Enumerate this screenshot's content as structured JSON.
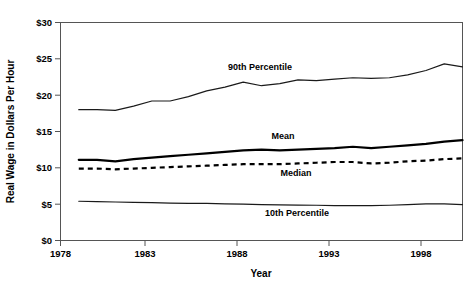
{
  "chart_data": {
    "type": "line",
    "title": "",
    "xlabel": "Year",
    "ylabel": "Real Wage in Dollars Per Hour",
    "xlim": [
      1978,
      2000
    ],
    "ylim": [
      0,
      30
    ],
    "grid": false,
    "legend_position": "inline-annotations",
    "x_ticks": [
      "1978",
      "1983",
      "1988",
      "1993",
      "1998"
    ],
    "x_tick_values": [
      1978,
      1983,
      1988,
      1993,
      1998
    ],
    "y_ticks": [
      "$0",
      "$5",
      "$10",
      "$15",
      "$20",
      "$25",
      "$30"
    ],
    "y_tick_values": [
      0,
      5,
      10,
      15,
      20,
      25,
      30
    ],
    "x": [
      1979,
      1980,
      1981,
      1982,
      1983,
      1984,
      1985,
      1986,
      1987,
      1988,
      1989,
      1990,
      1991,
      1992,
      1993,
      1994,
      1995,
      1996,
      1997,
      1998,
      1999,
      2000
    ],
    "series": [
      {
        "name": "90th Percentile",
        "style": "solid",
        "color": "#1a1a1a",
        "values": [
          18.0,
          18.0,
          17.9,
          18.5,
          19.2,
          19.2,
          19.8,
          20.6,
          21.1,
          21.8,
          21.3,
          21.6,
          22.1,
          22.0,
          22.2,
          22.4,
          22.3,
          22.4,
          22.8,
          23.4,
          24.3,
          23.9
        ]
      },
      {
        "name": "Mean",
        "style": "solid",
        "color": "#000000",
        "values": [
          11.1,
          11.1,
          10.9,
          11.2,
          11.4,
          11.6,
          11.8,
          12.0,
          12.2,
          12.4,
          12.5,
          12.4,
          12.5,
          12.6,
          12.7,
          12.9,
          12.7,
          12.9,
          13.1,
          13.3,
          13.6,
          13.8
        ]
      },
      {
        "name": "Median",
        "style": "dashed",
        "color": "#000000",
        "values": [
          9.9,
          9.9,
          9.8,
          9.9,
          10.0,
          10.1,
          10.2,
          10.3,
          10.4,
          10.5,
          10.5,
          10.5,
          10.6,
          10.7,
          10.8,
          10.8,
          10.6,
          10.7,
          10.9,
          11.0,
          11.2,
          11.3
        ]
      },
      {
        "name": "10th Percentile",
        "style": "solid",
        "color": "#1a1a1a",
        "values": [
          5.4,
          5.35,
          5.3,
          5.25,
          5.2,
          5.15,
          5.1,
          5.1,
          5.05,
          5.0,
          4.95,
          4.9,
          4.88,
          4.85,
          4.8,
          4.8,
          4.8,
          4.85,
          4.95,
          5.05,
          5.05,
          4.95
        ]
      }
    ],
    "annotations": [
      {
        "text": "90th Percentile",
        "x_px": 260,
        "y_px": 70
      },
      {
        "text": "Mean",
        "x_px": 283,
        "y_px": 139
      },
      {
        "text": "Median",
        "x_px": 296,
        "y_px": 176
      },
      {
        "text": "10th Percentile",
        "x_px": 297,
        "y_px": 216
      }
    ]
  },
  "figure": {
    "caption": ""
  }
}
